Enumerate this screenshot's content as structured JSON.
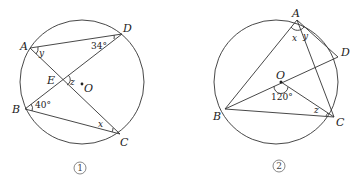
{
  "figures": [
    {
      "caption": "1",
      "points": {
        "A": "A",
        "B": "B",
        "C": "C",
        "D": "D",
        "E": "E",
        "O": "O"
      },
      "angles": {
        "ADB": "34°",
        "ABD": "40°",
        "x": "x",
        "y": "y",
        "z": "z"
      }
    },
    {
      "caption": "2",
      "points": {
        "A": "A",
        "B": "B",
        "C": "C",
        "D": "D",
        "O": "O"
      },
      "angles": {
        "BOC": "120°",
        "x": "x",
        "y": "y",
        "z": "z"
      }
    }
  ]
}
